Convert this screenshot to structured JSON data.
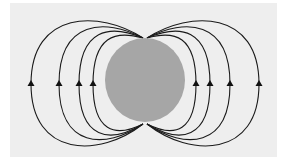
{
  "diagram": {
    "type": "dipole-field-lines",
    "background_color": "#eeeeee",
    "body": {
      "shape": "circle",
      "cx": 145,
      "cy": 80,
      "rx": 40,
      "ry": 42,
      "color": "#a6a6a6"
    },
    "line_color": "#1a1a1a",
    "arrow_direction": "up",
    "left_arrows_x": [
      31,
      59,
      79,
      93
    ],
    "right_arrows_x": [
      196,
      210,
      230,
      259
    ],
    "arrow_y": 84
  }
}
